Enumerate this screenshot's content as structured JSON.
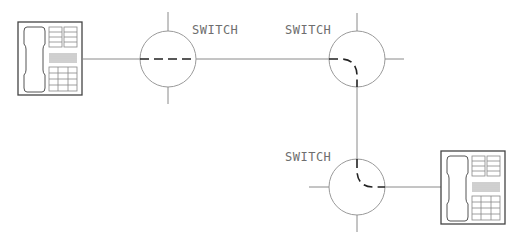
{
  "diagram": {
    "type": "circuit-switched telephone path",
    "nodes": [
      {
        "id": "phone-left",
        "kind": "telephone"
      },
      {
        "id": "switch-1",
        "kind": "switch",
        "label": "SWITCH"
      },
      {
        "id": "switch-2",
        "kind": "switch",
        "label": "SWITCH"
      },
      {
        "id": "switch-3",
        "kind": "switch",
        "label": "SWITCH"
      },
      {
        "id": "phone-right",
        "kind": "telephone"
      }
    ],
    "edges": [
      {
        "from": "phone-left",
        "to": "switch-1"
      },
      {
        "from": "switch-1",
        "to": "switch-2"
      },
      {
        "from": "switch-2",
        "to": "switch-3"
      },
      {
        "from": "switch-3",
        "to": "phone-right"
      }
    ],
    "path_style": "dashed route through each switch",
    "colors": {
      "line": "#8a8a8a",
      "dashed_path": "#222222",
      "label": "#6e6e6e",
      "phone_outline": "#444444"
    }
  },
  "labels": {
    "switch1": "SWITCH",
    "switch2": "SWITCH",
    "switch3": "SWITCH"
  }
}
